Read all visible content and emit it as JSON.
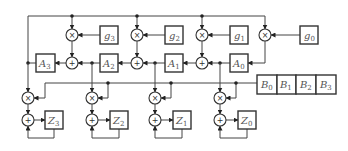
{
  "diagram": {
    "title": "",
    "g_coefficients": [
      {
        "id": "g3",
        "base": "g",
        "sub": "3"
      },
      {
        "id": "g2",
        "base": "g",
        "sub": "2"
      },
      {
        "id": "g1",
        "base": "g",
        "sub": "1"
      },
      {
        "id": "g0",
        "base": "g",
        "sub": "0"
      }
    ],
    "a_registers": [
      {
        "id": "A3",
        "base": "A",
        "sub": "3"
      },
      {
        "id": "A2",
        "base": "A",
        "sub": "2"
      },
      {
        "id": "A1",
        "base": "A",
        "sub": "1"
      },
      {
        "id": "A0",
        "base": "A",
        "sub": "0"
      }
    ],
    "b_register": [
      {
        "id": "B0",
        "base": "B",
        "sub": "0"
      },
      {
        "id": "B1",
        "base": "B",
        "sub": "1"
      },
      {
        "id": "B2",
        "base": "B",
        "sub": "2"
      },
      {
        "id": "B3",
        "base": "B",
        "sub": "3"
      }
    ],
    "z_registers": [
      {
        "id": "Z3",
        "base": "Z",
        "sub": "3"
      },
      {
        "id": "Z2",
        "base": "Z",
        "sub": "2"
      },
      {
        "id": "Z1",
        "base": "Z",
        "sub": "1"
      },
      {
        "id": "Z0",
        "base": "Z",
        "sub": "0"
      }
    ],
    "operators": {
      "multiply": "×",
      "add": "+"
    }
  }
}
